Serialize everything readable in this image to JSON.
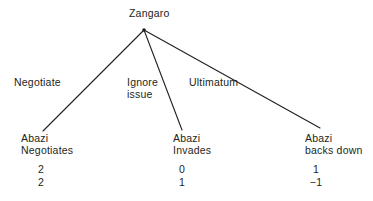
{
  "diagram": {
    "type": "game-tree",
    "title_node": "Zangaro",
    "line_color": "#231f20",
    "text_color": "#231f20",
    "background": "#ffffff",
    "root": {
      "player": "Zangaro",
      "apex": {
        "x": 144,
        "y": 30
      }
    },
    "branches": [
      {
        "action": "Negotiate",
        "action_line1": "Negotiate",
        "action_line2": "",
        "end": {
          "x": 43,
          "y": 131
        },
        "outcome_line1": "Abazi",
        "outcome_line2": "Negotiates",
        "payoff_top": "2",
        "payoff_bottom": "2"
      },
      {
        "action": "Ignore issue",
        "action_line1": "Ignore",
        "action_line2": "issue",
        "end": {
          "x": 182,
          "y": 130
        },
        "outcome_line1": "Abazi",
        "outcome_line2": "Invades",
        "payoff_top": "0",
        "payoff_bottom": "1"
      },
      {
        "action": "Ultimatum",
        "action_line1": "Ultimatum",
        "action_line2": "",
        "end": {
          "x": 320,
          "y": 128
        },
        "outcome_line1": "Abazi",
        "outcome_line2": "backs down",
        "payoff_top": "1",
        "payoff_bottom": "−1"
      }
    ]
  }
}
